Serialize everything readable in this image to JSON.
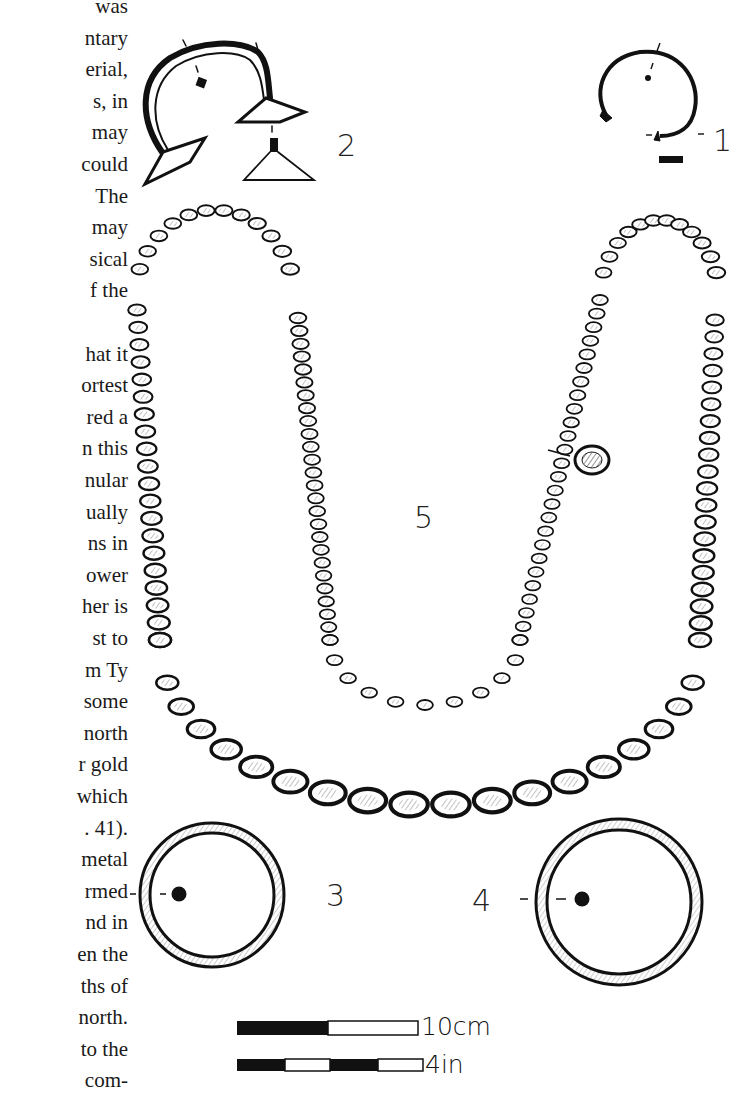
{
  "text_column": {
    "lines": [
      "was",
      "ntary",
      "erial,",
      "s,  in",
      "may",
      "could",
      "The",
      "may",
      "sical",
      "f  the",
      "",
      "hat it",
      "ortest",
      "red  a",
      "n this",
      "nular",
      "ually",
      "ns  in",
      "ower",
      "her  is",
      "st  to",
      "m Ty",
      "some",
      "north",
      "r gold",
      "which",
      ". 41).",
      "metal",
      "rmed",
      "nd in",
      "en the",
      "ths of",
      "north.",
      "to the",
      " com-"
    ]
  },
  "figure": {
    "labels": {
      "item1": "1",
      "item2": "2",
      "item3": "3",
      "item4": "4",
      "item5": "5"
    },
    "scale_bars": {
      "metric": {
        "label": "10cm",
        "segments": [
          "black",
          "white"
        ]
      },
      "imperial": {
        "label": "4in",
        "segments": [
          "black",
          "white",
          "black",
          "white"
        ]
      }
    },
    "items": [
      {
        "id": 1,
        "description": "penannular bracelet with expanded terminals and section"
      },
      {
        "id": 2,
        "description": "torc/bracelet with trumpet terminals and section"
      },
      {
        "id": 3,
        "description": "ring with circular section"
      },
      {
        "id": 4,
        "description": "ring with circular section"
      },
      {
        "id": 5,
        "description": "bead necklace with detached enlarged bead"
      }
    ]
  }
}
